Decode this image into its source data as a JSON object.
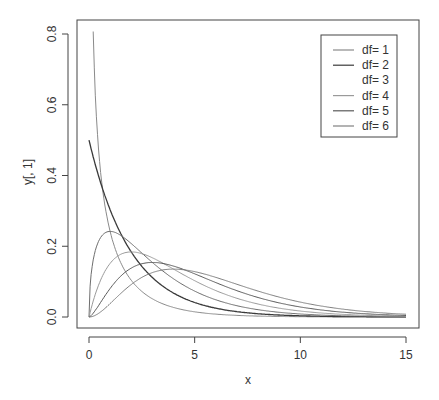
{
  "chart_data": {
    "type": "line",
    "title": "",
    "xlabel": "x",
    "ylabel": "y[, 1]",
    "xlim": [
      0,
      15
    ],
    "ylim": [
      0,
      0.8
    ],
    "x_ticks": [
      0,
      5,
      10,
      15
    ],
    "x_tick_labels": [
      "0",
      "5",
      "10",
      "15"
    ],
    "y_ticks": [
      0.0,
      0.2,
      0.4,
      0.6,
      0.8
    ],
    "y_tick_labels": [
      "0.0",
      "0.2",
      "0.4",
      "0.6",
      "0.8"
    ],
    "grid": false,
    "legend_position": "topright",
    "x": [
      0,
      0.2,
      0.5,
      1,
      1.5,
      2,
      2.5,
      3,
      4,
      5,
      6,
      7,
      8,
      9,
      10,
      12,
      15
    ],
    "series": [
      {
        "name": "df= 1",
        "color": "#8a8a8a",
        "values": [
          null,
          0.807,
          0.439,
          0.242,
          0.154,
          0.104,
          0.0723,
          0.0514,
          0.027,
          0.0146,
          0.0081,
          0.00455,
          0.00258,
          0.00148,
          0.00085,
          0.00029,
          5.7e-05
        ]
      },
      {
        "name": "df= 2",
        "color": "#3a3a3a",
        "values": [
          0.5,
          0.452,
          0.389,
          0.303,
          0.236,
          0.184,
          0.143,
          0.112,
          0.068,
          0.041,
          0.025,
          0.0151,
          0.0092,
          0.0056,
          0.0034,
          0.0012,
          0.00028
        ]
      },
      {
        "name": "df= 3",
        "color": "#6e6e6e",
        "values": [
          0,
          0.161,
          0.22,
          0.242,
          0.231,
          0.208,
          0.181,
          0.154,
          0.108,
          0.073,
          0.049,
          0.0319,
          0.0206,
          0.0133,
          0.0085,
          0.0034,
          0.00085
        ]
      },
      {
        "name": "df= 4",
        "color": "#9a9a9a",
        "values": [
          0,
          0.0452,
          0.0974,
          0.152,
          0.177,
          0.184,
          0.179,
          0.167,
          0.135,
          0.103,
          0.075,
          0.053,
          0.0366,
          0.025,
          0.0168,
          0.0074,
          0.0021
        ]
      },
      {
        "name": "df= 5",
        "color": "#5a5a5a",
        "values": [
          0,
          0.0108,
          0.0366,
          0.0807,
          0.1154,
          0.1384,
          0.1506,
          0.1542,
          0.144,
          0.122,
          0.0973,
          0.0744,
          0.0551,
          0.0399,
          0.0283,
          0.0137,
          0.0043
        ]
      },
      {
        "name": "df= 6",
        "color": "#808080",
        "values": [
          0,
          0.0023,
          0.0122,
          0.0379,
          0.0664,
          0.092,
          0.112,
          0.1255,
          0.1353,
          0.1283,
          0.112,
          0.0925,
          0.0733,
          0.0562,
          0.0421,
          0.0223,
          0.0078
        ]
      }
    ]
  },
  "legend": {
    "items": [
      {
        "label": "df= 1",
        "color": "#8a8a8a"
      },
      {
        "label": "df= 2",
        "color": "#3a3a3a"
      },
      {
        "label": "df= 3",
        "color": "#ffffff"
      },
      {
        "label": "df= 4",
        "color": "#9a9a9a"
      },
      {
        "label": "df= 5",
        "color": "#5a5a5a"
      },
      {
        "label": "df= 6",
        "color": "#808080"
      }
    ]
  },
  "axes": {
    "xlabel": "x",
    "ylabel": "y[, 1]"
  }
}
